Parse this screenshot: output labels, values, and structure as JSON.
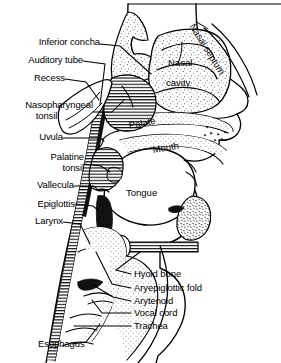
{
  "figure": {
    "type": "anatomical-line-diagram",
    "view": "midsagittal",
    "ink_color": "#000000",
    "background_color": "#ffffff"
  },
  "leader_labels": [
    {
      "id": "inferior-concha",
      "text": "Inferior concha"
    },
    {
      "id": "auditory-tube",
      "text": "Auditory tube"
    },
    {
      "id": "recess",
      "text": "Recess"
    },
    {
      "id": "nasopharyngeal-tonsil-l1",
      "text": "Nasopharyngeal"
    },
    {
      "id": "nasopharyngeal-tonsil-l2",
      "text": "tonsil"
    },
    {
      "id": "uvula",
      "text": "Uvula"
    },
    {
      "id": "palatine-tonsil-l1",
      "text": "Palatine"
    },
    {
      "id": "palatine-tonsil-l2",
      "text": "tonsil"
    },
    {
      "id": "vallecula",
      "text": "Vallecula"
    },
    {
      "id": "epiglottis",
      "text": "Epiglottis"
    },
    {
      "id": "larynx",
      "text": "Larynx"
    },
    {
      "id": "hyoid-bone",
      "text": "Hyoid bone"
    },
    {
      "id": "aryepiglottic-fold",
      "text": "Aryepiglottic fold"
    },
    {
      "id": "arytenoid",
      "text": "Arytenoid"
    },
    {
      "id": "vocal-cord",
      "text": "Vocal cord"
    },
    {
      "id": "trachea",
      "text": "Trachea"
    },
    {
      "id": "esophagus",
      "text": "Esophagus"
    }
  ],
  "inner_labels": [
    {
      "id": "nasal-cavity-l1",
      "text": "Nasal"
    },
    {
      "id": "nasal-cavity-l2",
      "text": "cavity"
    },
    {
      "id": "nasal-septum",
      "text": "Nasal septum"
    },
    {
      "id": "palate",
      "text": "Palate"
    },
    {
      "id": "mouth",
      "text": "Mouth"
    },
    {
      "id": "tongue",
      "text": "Tongue"
    }
  ]
}
